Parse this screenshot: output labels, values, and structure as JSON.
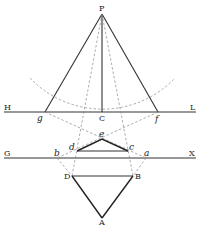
{
  "diagram": {
    "points": {
      "P": {
        "label": "P",
        "x": 102,
        "y": 14
      },
      "C": {
        "label": "C",
        "x": 102,
        "y": 112
      },
      "H": {
        "label": "H",
        "x": 4,
        "y": 112
      },
      "L": {
        "label": "L",
        "x": 196,
        "y": 112
      },
      "G": {
        "label": "G",
        "x": 4,
        "y": 158
      },
      "X": {
        "label": "X",
        "x": 196,
        "y": 158
      },
      "g": {
        "label": "g",
        "x": 45,
        "y": 112
      },
      "f": {
        "label": "f",
        "x": 158,
        "y": 112
      },
      "e": {
        "label": "e",
        "x": 102,
        "y": 139
      },
      "d": {
        "label": "d",
        "x": 77,
        "y": 151
      },
      "c": {
        "label": "c",
        "x": 128,
        "y": 151
      },
      "b": {
        "label": "b",
        "x": 57,
        "y": 158
      },
      "a": {
        "label": "a",
        "x": 146,
        "y": 158
      },
      "D": {
        "label": "D",
        "x": 72,
        "y": 176
      },
      "B": {
        "label": "B",
        "x": 133,
        "y": 176
      },
      "A": {
        "label": "A",
        "x": 102,
        "y": 218
      }
    },
    "lines": {
      "horizon": "HL",
      "ground": "GX"
    }
  }
}
